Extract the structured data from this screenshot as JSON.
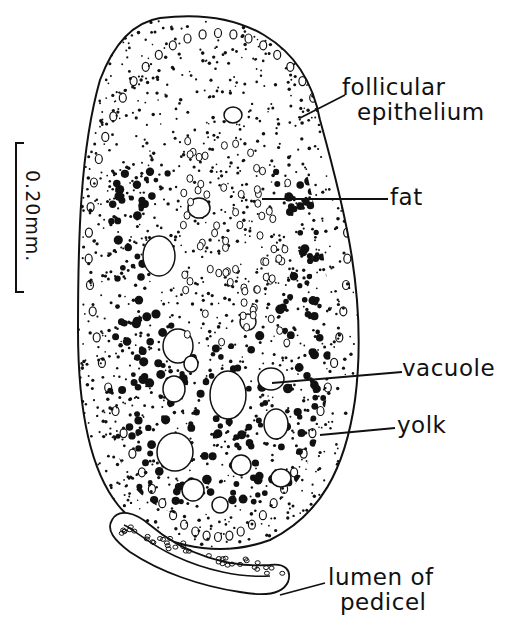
{
  "figure": {
    "scale_bar": {
      "label": "0.20mm."
    },
    "labels": [
      {
        "id": "follicular_epithelium",
        "line1": "follicular",
        "line2": "epithelium"
      },
      {
        "id": "fat",
        "line1": "fat"
      },
      {
        "id": "vacuole",
        "line1": "vacuole"
      },
      {
        "id": "yolk",
        "line1": "yolk"
      },
      {
        "id": "lumen_of_pedicel",
        "line1": "lumen of",
        "line2": "pedicel"
      }
    ]
  },
  "colors": {
    "ink": "#111111",
    "paper": "#ffffff"
  }
}
